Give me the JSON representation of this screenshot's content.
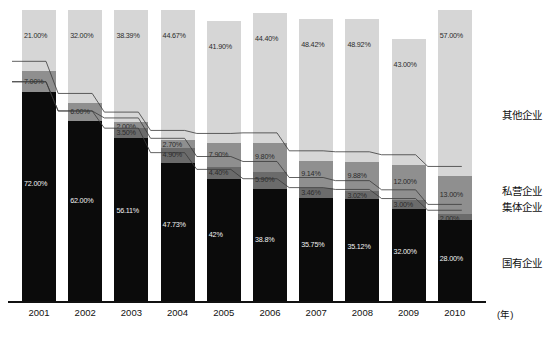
{
  "chart_data": {
    "type": "bar",
    "stacked": true,
    "title": "",
    "subtitle": "",
    "xlabel": "(年)",
    "ylabel": "",
    "ylim": [
      0,
      100
    ],
    "grid": false,
    "legend_position": "right",
    "categories": [
      "2001",
      "2002",
      "2003",
      "2004",
      "2005",
      "2006",
      "2007",
      "2008",
      "2009",
      "2010"
    ],
    "series": [
      {
        "name": "国有企业",
        "color": "#0b0b0b",
        "values": [
          72.0,
          62.0,
          56.11,
          47.73,
          42.0,
          38.8,
          35.75,
          35.12,
          32.0,
          28.0
        ],
        "labels": [
          "72.00%",
          "62.00%",
          "56.11%",
          "47.73%",
          "42%",
          "38.8%",
          "35.75%",
          "35.12%",
          "32.00%",
          "28.00%"
        ]
      },
      {
        "name": "集体企业",
        "color": "#6b6b6b",
        "values": [
          0.0,
          0.0,
          3.5,
          4.9,
          4.4,
          5.9,
          3.46,
          3.02,
          3.0,
          2.0
        ],
        "labels": [
          "",
          "",
          "3.50%",
          "4.90%",
          "4.40%",
          "5.90%",
          "3.46%",
          "3.02%",
          "3.00%",
          "2.00%"
        ]
      },
      {
        "name": "私营企业",
        "color": "#8f8f8f",
        "values": [
          7.0,
          6.0,
          2.0,
          2.7,
          7.9,
          9.8,
          9.14,
          9.88,
          12.0,
          13.0
        ],
        "labels": [
          "7.00%",
          "6.00%",
          "2.00%",
          "2.70%",
          "7.90%",
          "9.80%",
          "9.14%",
          "9.88%",
          "12.00%",
          "13.00%"
        ]
      },
      {
        "name": "其他企业",
        "color": "#d6d6d6",
        "values": [
          21.0,
          32.0,
          38.39,
          44.67,
          41.9,
          44.4,
          48.42,
          48.92,
          43.0,
          57.0
        ],
        "labels": [
          "21.00%",
          "32.00%",
          "38.39%",
          "44.67%",
          "41.90%",
          "44.40%",
          "48.42%",
          "48.92%",
          "43.00%",
          "57.00%"
        ]
      }
    ]
  },
  "axis": {
    "x_ticks": [
      "2001",
      "2002",
      "2003",
      "2004",
      "2005",
      "2006",
      "2007",
      "2008",
      "2009",
      "2010"
    ],
    "x_unit": "(年)"
  },
  "legend": {
    "items": [
      {
        "label": "其他企业",
        "color": "#d6d6d6"
      },
      {
        "label": "私营企业",
        "color": "#8f8f8f"
      },
      {
        "label": "集体企业",
        "color": "#6b6b6b"
      },
      {
        "label": "国有企业",
        "color": "#0b0b0b"
      }
    ]
  }
}
